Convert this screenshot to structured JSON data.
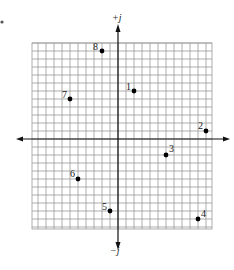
{
  "figure": {
    "problem_mark": "•",
    "axis_labels": {
      "positive_imag": "+j",
      "negative_imag": "−j"
    },
    "grid": {
      "x_left": 32,
      "x_right": 212,
      "y_top": 43,
      "y_bottom": 229,
      "origin_x": 118,
      "origin_y": 139,
      "cell": 8
    },
    "colors": {
      "grid": "#9a9a9a",
      "axis": "#111111",
      "point": "#000000",
      "text": "#1a1a1a"
    }
  },
  "chart_data": {
    "type": "scatter",
    "title": "",
    "xlabel": "Real",
    "ylabel": "Imaginary (j)",
    "xlim": [
      -11,
      12
    ],
    "ylim": [
      -11,
      12
    ],
    "grid": true,
    "points": [
      {
        "label": "1",
        "x": 2,
        "y": 6
      },
      {
        "label": "2",
        "x": 11,
        "y": 1
      },
      {
        "label": "3",
        "x": 6,
        "y": -2
      },
      {
        "label": "4",
        "x": 10,
        "y": -10
      },
      {
        "label": "5",
        "x": -1,
        "y": -9
      },
      {
        "label": "6",
        "x": -5,
        "y": -5
      },
      {
        "label": "7",
        "x": -6,
        "y": 5
      },
      {
        "label": "8",
        "x": -2,
        "y": 11
      }
    ]
  }
}
